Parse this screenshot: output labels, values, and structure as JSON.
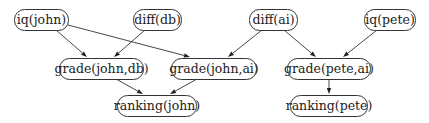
{
  "diagram": {
    "type": "directed-graph",
    "nodes": [
      {
        "id": "iq_john",
        "label": "iq(john)",
        "x": 14,
        "y": 9,
        "w": 54,
        "h": 21
      },
      {
        "id": "diff_db",
        "label": "diff(db)",
        "x": 133,
        "y": 9,
        "w": 48,
        "h": 21
      },
      {
        "id": "diff_ai",
        "label": "diff(ai)",
        "x": 249,
        "y": 9,
        "w": 48,
        "h": 21
      },
      {
        "id": "iq_pete",
        "label": "iq(pete)",
        "x": 364,
        "y": 9,
        "w": 51,
        "h": 21
      },
      {
        "id": "grade_john_db",
        "label": "grade(john,db)",
        "x": 59,
        "y": 58,
        "w": 84,
        "h": 21
      },
      {
        "id": "grade_john_ai",
        "label": "grade(john,ai)",
        "x": 171,
        "y": 58,
        "w": 85,
        "h": 21
      },
      {
        "id": "grade_pete_ai",
        "label": "grade(pete,ai)",
        "x": 287,
        "y": 58,
        "w": 83,
        "h": 21
      },
      {
        "id": "ranking_john",
        "label": "ranking(john)",
        "x": 117,
        "y": 95,
        "w": 79,
        "h": 21
      },
      {
        "id": "ranking_pete",
        "label": "ranking(pete)",
        "x": 290,
        "y": 95,
        "w": 77,
        "h": 21
      }
    ],
    "edges": [
      {
        "from": "iq_john",
        "to": "grade_john_db",
        "x1": 56,
        "y1": 30,
        "x2": 87,
        "y2": 57
      },
      {
        "from": "iq_john",
        "to": "grade_john_ai",
        "x1": 68,
        "y1": 25,
        "x2": 190,
        "y2": 57
      },
      {
        "from": "diff_db",
        "to": "grade_john_db",
        "x1": 145,
        "y1": 30,
        "x2": 114,
        "y2": 57
      },
      {
        "from": "diff_ai",
        "to": "grade_john_ai",
        "x1": 262,
        "y1": 30,
        "x2": 228,
        "y2": 57
      },
      {
        "from": "diff_ai",
        "to": "grade_pete_ai",
        "x1": 284,
        "y1": 30,
        "x2": 316,
        "y2": 57
      },
      {
        "from": "iq_pete",
        "to": "grade_pete_ai",
        "x1": 377,
        "y1": 30,
        "x2": 343,
        "y2": 57
      },
      {
        "from": "grade_john_db",
        "to": "ranking_john",
        "x1": 116,
        "y1": 79,
        "x2": 143,
        "y2": 94
      },
      {
        "from": "grade_john_ai",
        "to": "ranking_john",
        "x1": 197,
        "y1": 79,
        "x2": 170,
        "y2": 94
      },
      {
        "from": "grade_pete_ai",
        "to": "ranking_pete",
        "x1": 329,
        "y1": 79,
        "x2": 329,
        "y2": 94
      }
    ]
  }
}
